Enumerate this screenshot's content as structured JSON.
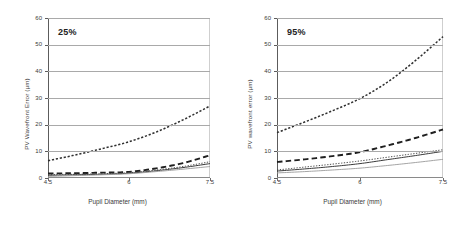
{
  "figure": {
    "panels": [
      {
        "tag": "25%",
        "ylabel": "PV Wavefront Error  (µm)",
        "xlabel": "Pupil Diameter  (mm)",
        "ytick_labels": [
          "60",
          "50",
          "40",
          "30",
          "20",
          "10",
          "0"
        ],
        "xtick_labels": [
          "4.5",
          "6",
          "7.5"
        ]
      },
      {
        "tag": "95%",
        "ylabel": "PV wavefront error (µm)",
        "xlabel": "Pupil Diameter  (mm)",
        "ytick_labels": [
          "60",
          "50",
          "40",
          "30",
          "20",
          "10",
          "0"
        ],
        "xtick_labels": [
          "4.5",
          "6",
          "7.5"
        ]
      }
    ]
  },
  "chart_data": [
    {
      "type": "line",
      "title": "25%",
      "xlabel": "Pupil Diameter  (mm)",
      "ylabel": "PV Wavefront Error  (µm)",
      "xlim": [
        4.5,
        7.5
      ],
      "ylim": [
        0,
        60
      ],
      "yticks": [
        0,
        10,
        20,
        30,
        40,
        50,
        60
      ],
      "xticks": [
        4.5,
        6,
        7.5
      ],
      "grid": true,
      "legend": "none",
      "x": [
        4.5,
        5.0,
        5.5,
        6.0,
        6.5,
        7.0,
        7.5
      ],
      "series": [
        {
          "name": "series-1-fine-dotted-upper",
          "style": "fine-dotted",
          "color": "#2f2f2f",
          "values": [
            6.5,
            8.6,
            11.0,
            13.6,
            17.2,
            21.8,
            27.0
          ]
        },
        {
          "name": "series-2-heavy-dashed",
          "style": "heavy-dashed",
          "color": "#1f1f1f",
          "values": [
            1.7,
            1.8,
            2.0,
            2.3,
            3.6,
            5.6,
            8.5
          ]
        },
        {
          "name": "series-3-dotted",
          "style": "dotted",
          "color": "#4a4a4a",
          "values": [
            1.3,
            1.4,
            1.6,
            2.0,
            3.0,
            4.3,
            6.1
          ]
        },
        {
          "name": "series-4-solid-dark",
          "style": "solid",
          "color": "#3a3a3a",
          "values": [
            1.0,
            1.2,
            1.4,
            1.8,
            2.7,
            3.9,
            5.4
          ]
        },
        {
          "name": "series-5-solid-gray",
          "style": "solid-thin",
          "color": "#9a9a9a",
          "values": [
            0.6,
            0.9,
            1.2,
            1.6,
            2.4,
            3.3,
            4.3
          ]
        }
      ]
    },
    {
      "type": "line",
      "title": "95%",
      "xlabel": "Pupil Diameter  (mm)",
      "ylabel": "PV wavefront error (µm)",
      "xlim": [
        4.5,
        7.5
      ],
      "ylim": [
        0,
        60
      ],
      "yticks": [
        0,
        10,
        20,
        30,
        40,
        50,
        60
      ],
      "xticks": [
        4.5,
        6,
        7.5
      ],
      "grid": true,
      "legend": "none",
      "x": [
        4.5,
        5.0,
        5.5,
        6.0,
        6.5,
        7.0,
        7.5
      ],
      "series": [
        {
          "name": "series-1-fine-dotted-upper",
          "style": "fine-dotted",
          "color": "#2f2f2f",
          "values": [
            17.0,
            21.0,
            25.2,
            29.8,
            36.0,
            44.0,
            53.0
          ]
        },
        {
          "name": "series-2-heavy-dashed",
          "style": "heavy-dashed",
          "color": "#1f1f1f",
          "values": [
            6.0,
            7.0,
            8.2,
            9.7,
            12.2,
            15.0,
            18.2
          ]
        },
        {
          "name": "series-3-dotted",
          "style": "dotted",
          "color": "#4a4a4a",
          "values": [
            3.0,
            4.1,
            5.2,
            6.4,
            7.8,
            9.2,
            10.6
          ]
        },
        {
          "name": "series-4-solid-dark",
          "style": "solid",
          "color": "#3a3a3a",
          "values": [
            2.6,
            3.4,
            4.3,
            5.4,
            6.9,
            8.4,
            10.0
          ]
        },
        {
          "name": "series-5-solid-gray",
          "style": "solid-thin",
          "color": "#9a9a9a",
          "values": [
            1.9,
            2.4,
            3.0,
            3.7,
            4.7,
            5.8,
            7.0
          ]
        }
      ]
    }
  ]
}
